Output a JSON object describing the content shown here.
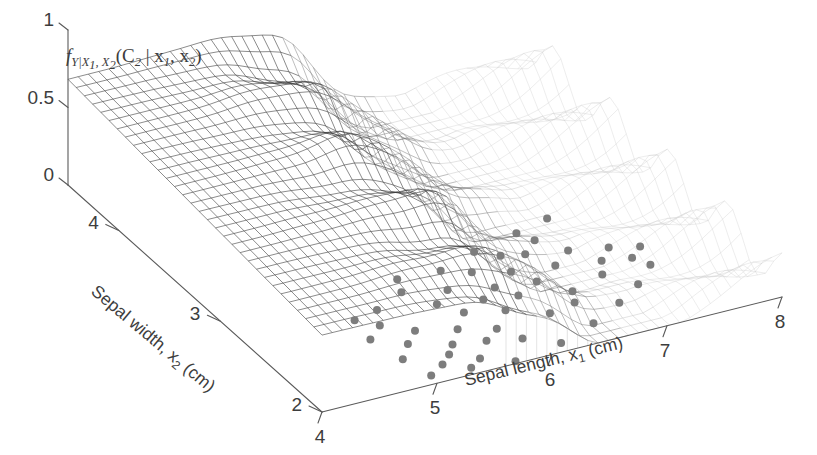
{
  "figure": {
    "kind": "3d-mesh-surface-plot",
    "background_color": "#ffffff",
    "axis_color": "#5a5a5a",
    "mesh_dark_color": "#3a3a3a",
    "mesh_light_color": "#c9c9c9",
    "datapoint_color": "#7d7d7d"
  },
  "axes": {
    "x": {
      "title_main": "Sepal length, x",
      "title_sub": "1",
      "title_unit": " (cm)",
      "ticks": [
        "4",
        "5",
        "6",
        "7",
        "8"
      ],
      "values": [
        4,
        5,
        6,
        7,
        8
      ],
      "range": [
        4,
        8
      ]
    },
    "y": {
      "title_main": "Sepal width, x",
      "title_sub": "2",
      "title_unit": " (cm)",
      "ticks": [
        "4",
        "3",
        "2"
      ],
      "values": [
        4,
        3,
        2
      ],
      "range": [
        2,
        4.5
      ]
    },
    "z": {
      "title_f": "f",
      "title_f_sub": "Y|X",
      "title_f_sub_1": "1",
      "title_f_sub_comma": ", X",
      "title_f_sub_2": "2",
      "title_args_open": "(C",
      "title_args_c_sub": "2",
      "title_args_bar": " | x",
      "title_args_x1_sub": "1",
      "title_args_comma": ", x",
      "title_args_x2_sub": "2",
      "title_args_close": ")",
      "ticks": [
        "1",
        "0.5",
        "0"
      ],
      "values": [
        1,
        0.5,
        0
      ],
      "range": [
        0,
        1
      ]
    }
  },
  "chart_data": {
    "type": "surface",
    "title": "",
    "xlabel": "Sepal length, x1 (cm)",
    "ylabel": "Sepal width, x2 (cm)",
    "zlabel": "f_{Y|X1,X2}(C2 | x1, x2)",
    "xlim": [
      4,
      8
    ],
    "ylim": [
      2,
      4.5
    ],
    "zlim": [
      0,
      1
    ],
    "grid": false,
    "legend": null,
    "surface": {
      "nx": 46,
      "ny": 32,
      "plateau_level": 0.62,
      "floor_level": 0.0,
      "transition_center_x": 6.05,
      "transition_width_x": 0.42,
      "ridge_amplitude": 0.1,
      "ridge_period_y": 0.55,
      "noise_amplitude": 0.055
    },
    "scatter": {
      "marker": "filled-circle",
      "marker_size_px": 8,
      "color": "#7d7d7d",
      "count": 52,
      "points": [
        [
          5.95,
          2.62
        ],
        [
          6.12,
          2.7
        ],
        [
          5.72,
          2.55
        ],
        [
          6.35,
          2.8
        ],
        [
          6.58,
          2.92
        ],
        [
          5.55,
          2.42
        ],
        [
          5.4,
          2.3
        ],
        [
          5.3,
          2.22
        ],
        [
          6.02,
          2.48
        ],
        [
          6.22,
          2.58
        ],
        [
          5.82,
          2.34
        ],
        [
          5.66,
          2.26
        ],
        [
          6.45,
          2.66
        ],
        [
          6.7,
          2.76
        ],
        [
          6.9,
          2.86
        ],
        [
          5.18,
          2.15
        ],
        [
          5.48,
          2.12
        ],
        [
          5.92,
          2.2
        ],
        [
          6.3,
          2.36
        ],
        [
          6.62,
          2.5
        ],
        [
          7.05,
          2.7
        ],
        [
          7.2,
          2.8
        ],
        [
          5.1,
          2.4
        ],
        [
          5.25,
          2.5
        ],
        [
          5.05,
          2.62
        ],
        [
          5.6,
          2.68
        ],
        [
          5.78,
          2.78
        ],
        [
          6.08,
          2.88
        ],
        [
          6.4,
          2.96
        ],
        [
          6.75,
          3.02
        ],
        [
          4.95,
          2.28
        ],
        [
          5.35,
          2.06
        ],
        [
          5.7,
          2.02
        ],
        [
          6.15,
          2.08
        ],
        [
          6.52,
          2.18
        ],
        [
          6.85,
          2.3
        ],
        [
          7.12,
          2.42
        ],
        [
          7.35,
          2.56
        ],
        [
          4.88,
          2.52
        ],
        [
          5.02,
          2.08
        ],
        [
          5.88,
          2.96
        ],
        [
          6.25,
          3.05
        ],
        [
          6.68,
          3.12
        ],
        [
          7.0,
          3.18
        ],
        [
          5.45,
          2.86
        ],
        [
          5.15,
          2.76
        ],
        [
          6.95,
          2.58
        ],
        [
          7.28,
          2.66
        ],
        [
          5.52,
          2.98
        ],
        [
          4.92,
          2.72
        ],
        [
          6.55,
          2.4
        ],
        [
          7.42,
          2.74
        ]
      ]
    }
  }
}
